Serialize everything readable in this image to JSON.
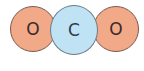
{
  "diagram": {
    "molecule": "CO2",
    "atoms": [
      {
        "label": "O",
        "element": "oxygen",
        "color": "#f2a987"
      },
      {
        "label": "C",
        "element": "carbon",
        "color": "#bfe3f5"
      },
      {
        "label": "O",
        "element": "oxygen",
        "color": "#f2a987"
      }
    ]
  }
}
